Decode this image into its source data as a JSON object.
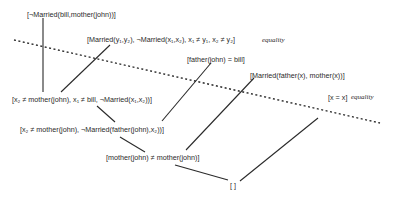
{
  "diagram": {
    "type": "resolution-proof-tree",
    "clauses": {
      "goal": "[¬Married(bill,mother(john))]",
      "married_eq": "[Married(y₁,y₂), ¬Married(x₁,x₂), x₁ ≠ y₁, x₂ ≠ y₂]",
      "married_eq_note": "equality",
      "father_fact": "[father(john) = bill]",
      "married_parents": "[Married(father(x), mother(x))]",
      "reflexive": "[x = x]",
      "reflexive_note": "equality",
      "step1": "[x₂ ≠ mother(john), x₁ ≠ bill, ¬Married(x₁,x₂))]",
      "step2": "[x₂ ≠ mother(john), ¬Married(father(john),x₂))]",
      "step3": "[mother(john) ≠ mother(john)]",
      "empty": "[ ]"
    },
    "separator": "dotted line separating background axioms from derived clauses"
  }
}
